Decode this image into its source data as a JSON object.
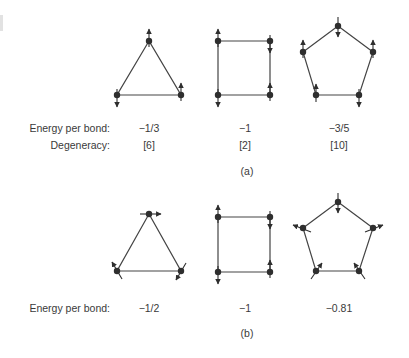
{
  "panel_a": {
    "caption": "(a)",
    "row_labels": {
      "energy": "Energy per bond:",
      "degeneracy": "Degeneracy:"
    },
    "columns": [
      {
        "shape": "triangle",
        "energy": "−1/3",
        "degeneracy": "[6]"
      },
      {
        "shape": "square",
        "energy": "−1",
        "degeneracy": "[2]"
      },
      {
        "shape": "pentagon",
        "energy": "−3/5",
        "degeneracy": "[10]"
      }
    ]
  },
  "panel_b": {
    "caption": "(b)",
    "row_labels": {
      "energy": "Energy per bond:"
    },
    "columns": [
      {
        "shape": "triangle",
        "energy": "−1/2"
      },
      {
        "shape": "square",
        "energy": "−1"
      },
      {
        "shape": "pentagon",
        "energy": "−0.81"
      }
    ]
  },
  "colors": {
    "line": "#444444",
    "node": "#2e2e2e",
    "text": "#3a3a3a"
  }
}
